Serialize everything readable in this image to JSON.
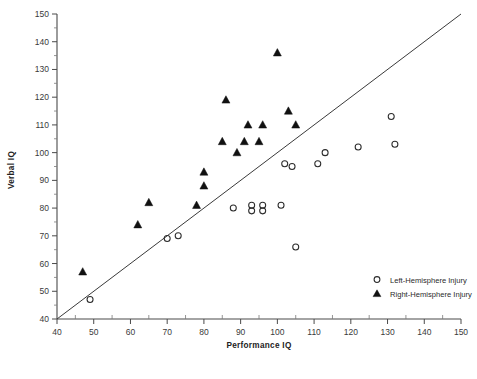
{
  "chart_data": {
    "type": "scatter",
    "title": "",
    "xlabel": "Performance  IQ",
    "ylabel": "Verbal  IQ",
    "xlim": [
      40,
      150
    ],
    "ylim": [
      40,
      150
    ],
    "xticks": [
      40,
      50,
      60,
      70,
      80,
      90,
      100,
      110,
      120,
      130,
      140,
      150
    ],
    "yticks": [
      40,
      50,
      60,
      70,
      80,
      90,
      100,
      110,
      120,
      130,
      140,
      150
    ],
    "xtick_labels": [
      "40",
      "50",
      "60",
      "70",
      "80",
      "90",
      "100",
      "110",
      "120",
      "130",
      "140",
      "150"
    ],
    "ytick_labels": [
      "40",
      "50",
      "60",
      "70",
      "80",
      "90",
      "100",
      "110",
      "120",
      "130",
      "140",
      "150"
    ],
    "grid": false,
    "minor_ticks": true,
    "legend_position": "bottom-right",
    "reference_line": {
      "label": "identity line",
      "from": [
        40,
        40
      ],
      "to": [
        150,
        150
      ]
    },
    "series": [
      {
        "name": "Left-Hemisphere Injury",
        "marker": "open-circle",
        "color": "#2b2b2b",
        "points": [
          [
            49,
            47
          ],
          [
            70,
            69
          ],
          [
            73,
            70
          ],
          [
            88,
            80
          ],
          [
            93,
            81
          ],
          [
            93,
            79
          ],
          [
            96,
            81
          ],
          [
            96,
            79
          ],
          [
            101,
            81
          ],
          [
            102,
            96
          ],
          [
            104,
            95
          ],
          [
            105,
            66
          ],
          [
            111,
            96
          ],
          [
            113,
            100
          ],
          [
            122,
            102
          ],
          [
            132,
            103
          ],
          [
            131,
            113
          ]
        ]
      },
      {
        "name": "Right-Hemisphere Injury",
        "marker": "filled-triangle",
        "color": "#111111",
        "points": [
          [
            47,
            57
          ],
          [
            62,
            74
          ],
          [
            65,
            82
          ],
          [
            78,
            81
          ],
          [
            80,
            88
          ],
          [
            80,
            93
          ],
          [
            85,
            104
          ],
          [
            86,
            119
          ],
          [
            89,
            100
          ],
          [
            91,
            104
          ],
          [
            92,
            110
          ],
          [
            95,
            104
          ],
          [
            96,
            110
          ],
          [
            100,
            136
          ],
          [
            103,
            115
          ],
          [
            105,
            110
          ]
        ]
      }
    ]
  },
  "legend": {
    "entries": [
      {
        "marker": "open-circle",
        "label": "Left-Hemisphere Injury"
      },
      {
        "marker": "filled-triangle",
        "label": "Right-Hemisphere Injury"
      }
    ]
  }
}
